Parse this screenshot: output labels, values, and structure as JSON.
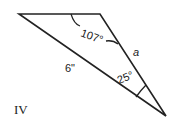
{
  "diagram": {
    "figure_label": "IV",
    "angle_top": "107°",
    "angle_bottom": "25°",
    "side_long": "6\"",
    "side_unknown": "a",
    "line_color": "#222222"
  }
}
